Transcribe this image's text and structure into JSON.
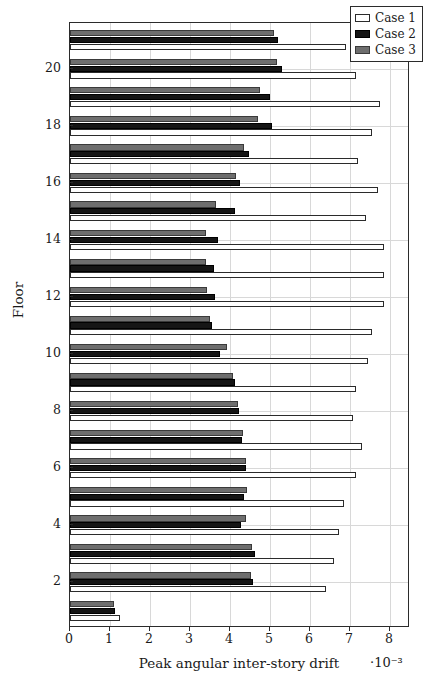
{
  "chart_data": {
    "type": "bar",
    "orientation": "horizontal",
    "title": "",
    "xlabel": "Peak angular inter-story drift",
    "xlabel_exponent": "·10⁻³",
    "ylabel": "Floor",
    "xlim": [
      0,
      8.5
    ],
    "ylim": [
      0.4,
      21.6
    ],
    "xticks": [
      0,
      1,
      2,
      3,
      4,
      5,
      6,
      7,
      8
    ],
    "xticklabels": [
      "0",
      "1",
      "2",
      "3",
      "4",
      "5",
      "6",
      "7",
      "8"
    ],
    "yticks": [
      2,
      4,
      6,
      8,
      10,
      12,
      14,
      16,
      18,
      20
    ],
    "yticklabels": [
      "2",
      "4",
      "6",
      "8",
      "10",
      "12",
      "14",
      "16",
      "18",
      "20"
    ],
    "grid": true,
    "grid_axis": "both",
    "legend_position": "top-right",
    "categories": [
      1,
      2,
      3,
      4,
      5,
      6,
      7,
      8,
      9,
      10,
      11,
      12,
      13,
      14,
      15,
      16,
      17,
      18,
      19,
      20,
      21
    ],
    "series": [
      {
        "name": "Case 1",
        "color": "#ffffff",
        "edgecolor": "#2b2b2b",
        "values": [
          1.24,
          6.4,
          6.6,
          6.73,
          6.85,
          7.16,
          7.3,
          7.08,
          7.16,
          7.46,
          7.55,
          7.85,
          7.85,
          7.85,
          7.4,
          7.7,
          7.2,
          7.55,
          7.75,
          7.15,
          6.9
        ]
      },
      {
        "name": "Case 2",
        "color": "#151515",
        "edgecolor": "#000000",
        "values": [
          1.12,
          4.57,
          4.63,
          4.28,
          4.35,
          4.4,
          4.3,
          4.23,
          4.12,
          3.76,
          3.54,
          3.63,
          3.6,
          3.7,
          4.13,
          4.25,
          4.48,
          5.04,
          5.0,
          5.3,
          5.2
        ]
      },
      {
        "name": "Case 3",
        "color": "#6e6e6e",
        "edgecolor": "#3a3a3a",
        "values": [
          1.09,
          4.53,
          4.56,
          4.4,
          4.42,
          4.4,
          4.33,
          4.2,
          4.08,
          3.93,
          3.5,
          3.42,
          3.4,
          3.4,
          3.64,
          4.15,
          4.36,
          4.7,
          4.74,
          5.17,
          5.1
        ]
      }
    ]
  },
  "legend": {
    "items": [
      {
        "label": "Case 1"
      },
      {
        "label": "Case 2"
      },
      {
        "label": "Case 3"
      }
    ]
  }
}
